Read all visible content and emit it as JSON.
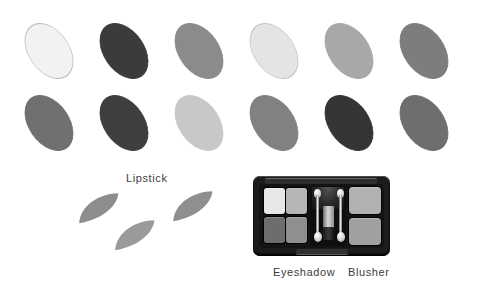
{
  "page": {
    "background_color": "#ffffff",
    "width": 481,
    "height": 298
  },
  "labels": {
    "lipstick": "Lipstick",
    "eyeshadow": "Eyeshadow",
    "blusher": "Blusher"
  },
  "swatch_grid": {
    "rows": 2,
    "columns": 6,
    "shape": "ellipse",
    "rotation_deg": -35,
    "ovals": [
      {
        "id": "oval-r1-c1",
        "row": 1,
        "col": 1,
        "left": 16,
        "top": 20,
        "width": 66,
        "height": 62,
        "color": "#f2f2f2",
        "border_color": "#b9b9b9",
        "tone": "near-white"
      },
      {
        "id": "oval-r1-c2",
        "row": 1,
        "col": 2,
        "left": 91,
        "top": 20,
        "width": 66,
        "height": 62,
        "color": "#3b3b3b",
        "border_color": "#3b3b3b",
        "tone": "very-dark"
      },
      {
        "id": "oval-r1-c3",
        "row": 1,
        "col": 3,
        "left": 166,
        "top": 20,
        "width": 66,
        "height": 62,
        "color": "#8b8b8b",
        "border_color": "#8b8b8b",
        "tone": "medium"
      },
      {
        "id": "oval-r1-c4",
        "row": 1,
        "col": 4,
        "left": 241,
        "top": 20,
        "width": 66,
        "height": 62,
        "color": "#e4e4e4",
        "border_color": "#c2c2c2",
        "tone": "very-light"
      },
      {
        "id": "oval-r1-c5",
        "row": 1,
        "col": 5,
        "left": 316,
        "top": 20,
        "width": 66,
        "height": 62,
        "color": "#a8a8a8",
        "border_color": "#a8a8a8",
        "tone": "light-medium"
      },
      {
        "id": "oval-r1-c6",
        "row": 1,
        "col": 6,
        "left": 391,
        "top": 20,
        "width": 66,
        "height": 62,
        "color": "#7d7d7d",
        "border_color": "#7d7d7d",
        "tone": "medium-dark"
      },
      {
        "id": "oval-r2-c1",
        "row": 2,
        "col": 1,
        "left": 16,
        "top": 92,
        "width": 66,
        "height": 62,
        "color": "#707070",
        "border_color": "#707070",
        "tone": "medium-dark"
      },
      {
        "id": "oval-r2-c2",
        "row": 2,
        "col": 2,
        "left": 91,
        "top": 92,
        "width": 66,
        "height": 62,
        "color": "#3e3e3e",
        "border_color": "#3e3e3e",
        "tone": "very-dark"
      },
      {
        "id": "oval-r2-c3",
        "row": 2,
        "col": 3,
        "left": 166,
        "top": 92,
        "width": 66,
        "height": 62,
        "color": "#c8c8c8",
        "border_color": "#c8c8c8",
        "tone": "light"
      },
      {
        "id": "oval-r2-c4",
        "row": 2,
        "col": 4,
        "left": 241,
        "top": 92,
        "width": 66,
        "height": 62,
        "color": "#818181",
        "border_color": "#818181",
        "tone": "medium"
      },
      {
        "id": "oval-r2-c5",
        "row": 2,
        "col": 5,
        "left": 316,
        "top": 92,
        "width": 66,
        "height": 62,
        "color": "#353535",
        "border_color": "#353535",
        "tone": "very-dark"
      },
      {
        "id": "oval-r2-c6",
        "row": 2,
        "col": 6,
        "left": 391,
        "top": 92,
        "width": 66,
        "height": 62,
        "color": "#6e6e6e",
        "border_color": "#6e6e6e",
        "tone": "medium-dark"
      }
    ]
  },
  "lipstick_section": {
    "label": "Lipstick",
    "label_left": 126,
    "label_top": 172,
    "swatches": [
      {
        "id": "lipstick-swatch-1",
        "left": 74,
        "top": 196,
        "width": 52,
        "height": 26,
        "rotation_deg": -16,
        "color": "#8d8d8d"
      },
      {
        "id": "lipstick-swatch-2",
        "left": 110,
        "top": 223,
        "width": 52,
        "height": 26,
        "rotation_deg": -16,
        "color": "#9a9a9a"
      },
      {
        "id": "lipstick-swatch-3",
        "left": 168,
        "top": 194,
        "width": 52,
        "height": 26,
        "rotation_deg": -16,
        "color": "#8f8f8f"
      }
    ]
  },
  "palette": {
    "name": "makeup-compact-palette",
    "case_color": "#1c1c1c",
    "eyeshadow_label": "Eyeshadow",
    "blusher_label": "Blusher",
    "eyeshadow_label_left": 273,
    "blusher_label_left": 348,
    "labels_top": 266,
    "eyeshadow_pans": [
      {
        "id": "pan-1",
        "left": 5,
        "top": 4,
        "width": 21,
        "height": 26,
        "color": "#e8e8e8"
      },
      {
        "id": "pan-2",
        "left": 27,
        "top": 4,
        "width": 21,
        "height": 26,
        "color": "#b6b6b6"
      },
      {
        "id": "pan-3",
        "left": 5,
        "top": 33,
        "width": 21,
        "height": 26,
        "color": "#6d6d6d"
      },
      {
        "id": "pan-4",
        "left": 27,
        "top": 33,
        "width": 21,
        "height": 26,
        "color": "#8f8f8f"
      }
    ],
    "blusher_pans": [
      {
        "id": "blush-1",
        "left": 90,
        "top": 3,
        "width": 32,
        "height": 27,
        "color": "#b1b1b1"
      },
      {
        "id": "blush-2",
        "left": 90,
        "top": 34,
        "width": 32,
        "height": 27,
        "color": "#a0a0a0"
      }
    ],
    "applicators": [
      {
        "id": "applicator-left",
        "left": 55,
        "top": 5
      },
      {
        "id": "applicator-right",
        "left": 78,
        "top": 5
      }
    ]
  }
}
